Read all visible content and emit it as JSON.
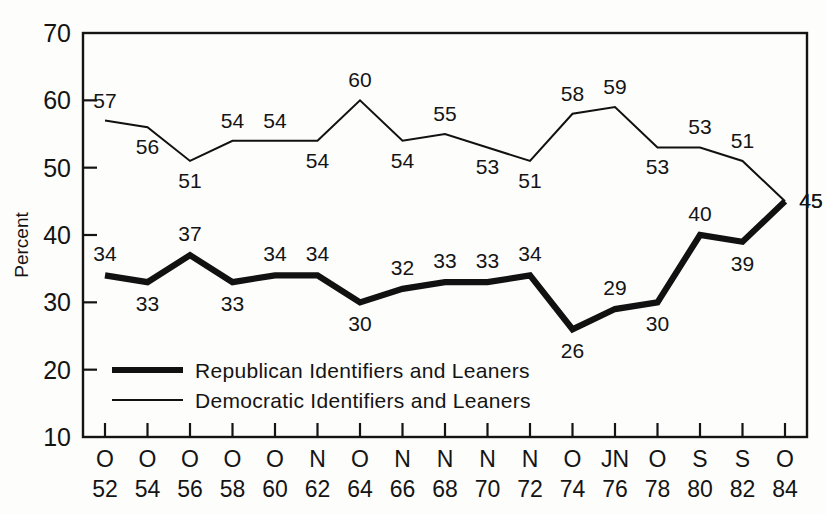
{
  "chart_data": {
    "type": "line",
    "title": "",
    "xlabel": "",
    "ylabel": "Percent",
    "ylim": [
      10,
      70
    ],
    "yticks": [
      10,
      20,
      30,
      40,
      50,
      60,
      70
    ],
    "grid": false,
    "legend_position": "inside-lower-left",
    "categories": [
      "52",
      "54",
      "56",
      "58",
      "60",
      "62",
      "64",
      "66",
      "68",
      "70",
      "72",
      "74",
      "76",
      "78",
      "80",
      "82",
      "84"
    ],
    "x_tick_months": [
      "O",
      "O",
      "O",
      "O",
      "O",
      "N",
      "O",
      "N",
      "N",
      "N",
      "N",
      "O",
      "JN",
      "O",
      "S",
      "S",
      "O"
    ],
    "x_tick_years": [
      "52",
      "54",
      "56",
      "58",
      "60",
      "62",
      "64",
      "66",
      "68",
      "70",
      "72",
      "74",
      "76",
      "78",
      "80",
      "82",
      "84"
    ],
    "series": [
      {
        "name": "Republican Identifiers and Leaners",
        "style": "thick",
        "values": [
          34,
          33,
          37,
          33,
          34,
          34,
          30,
          32,
          33,
          33,
          34,
          26,
          29,
          30,
          40,
          39,
          45
        ],
        "label_positions": [
          "above",
          "below",
          "above",
          "below",
          "above",
          "above",
          "below",
          "above",
          "above",
          "above",
          "above",
          "below",
          "above",
          "below",
          "above",
          "below",
          "right"
        ]
      },
      {
        "name": "Democratic Identifiers and Leaners",
        "style": "thin",
        "values": [
          57,
          56,
          51,
          54,
          54,
          54,
          60,
          54,
          55,
          53,
          51,
          58,
          59,
          53,
          53,
          51,
          45
        ],
        "label_positions": [
          "above",
          "below",
          "below",
          "above",
          "above",
          "below",
          "above",
          "below",
          "above",
          "below",
          "below",
          "above",
          "above",
          "below",
          "above",
          "above",
          "right"
        ]
      }
    ]
  },
  "axis": {
    "y_label": "Percent",
    "y_tick_labels": [
      "70",
      "60",
      "50",
      "40",
      "30",
      "20",
      "10"
    ]
  },
  "legend": {
    "items": [
      {
        "label": "Republican Identifiers and Leaners",
        "style": "thick"
      },
      {
        "label": "Democratic Identifiers and Leaners",
        "style": "thin"
      }
    ]
  }
}
